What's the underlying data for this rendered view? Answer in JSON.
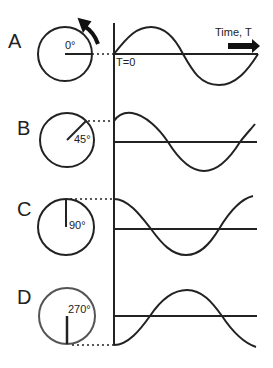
{
  "diagram": {
    "axis": {
      "time_label": "Time, T",
      "origin_label": "T=0"
    },
    "rows": [
      {
        "id": "A",
        "letter": "A",
        "angle_label": "0°",
        "phase_deg": 0
      },
      {
        "id": "B",
        "letter": "B",
        "angle_label": "45°",
        "phase_deg": 45
      },
      {
        "id": "C",
        "letter": "C",
        "angle_label": "90°",
        "phase_deg": 90
      },
      {
        "id": "D",
        "letter": "D",
        "angle_label": "270°",
        "phase_deg": 270
      }
    ],
    "colors": {
      "stroke": "#222222",
      "circle_d": "#555555",
      "background": "#ffffff"
    }
  }
}
